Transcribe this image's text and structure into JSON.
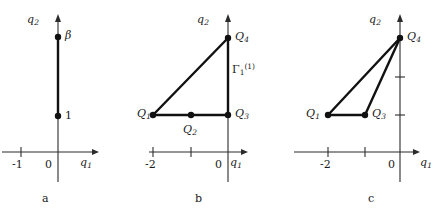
{
  "figure": {
    "axis_labels": {
      "x": "q",
      "x_sub": "1",
      "y": "q",
      "y_sub": "2"
    },
    "panels": [
      {
        "letter": "a",
        "ticks_x": [
          {
            "label": "-1",
            "value": -1
          },
          {
            "label": "0",
            "value": 0
          }
        ],
        "points": [
          {
            "name": "beta-point",
            "label": "β",
            "x": 0,
            "y": 3
          },
          {
            "name": "one-point",
            "label": "1",
            "x": 0,
            "y": 1
          }
        ],
        "segments": [
          {
            "from": [
              0,
              1
            ],
            "to": [
              0,
              3
            ]
          }
        ]
      },
      {
        "letter": "b",
        "ticks_x": [
          {
            "label": "-2",
            "value": -2
          },
          {
            "label": "",
            "value": -1
          },
          {
            "label": "0",
            "value": 0
          }
        ],
        "edge_label": {
          "text": "Γ",
          "sub": "1",
          "sup": "(1)"
        },
        "points": [
          {
            "name": "Q1",
            "label": "Q",
            "sub": "1",
            "x": -2,
            "y": 1
          },
          {
            "name": "Q2",
            "label": "Q",
            "sub": "2",
            "x": -1,
            "y": 1
          },
          {
            "name": "Q3",
            "label": "Q",
            "sub": "3",
            "x": 0,
            "y": 1
          },
          {
            "name": "Q4",
            "label": "Q",
            "sub": "4",
            "x": 0,
            "y": 3
          }
        ],
        "segments": [
          {
            "from": [
              -2,
              1
            ],
            "to": [
              0,
              1
            ]
          },
          {
            "from": [
              0,
              1
            ],
            "to": [
              0,
              3
            ]
          },
          {
            "from": [
              -2,
              1
            ],
            "to": [
              0,
              3
            ]
          }
        ]
      },
      {
        "letter": "c",
        "ticks_x": [
          {
            "label": "-2",
            "value": -2
          },
          {
            "label": "",
            "value": -1
          },
          {
            "label": "0",
            "value": 0
          }
        ],
        "ticks_y": [
          {
            "label": "",
            "value": 1
          },
          {
            "label": "",
            "value": 2
          }
        ],
        "points": [
          {
            "name": "Q1",
            "label": "Q",
            "sub": "1",
            "x": -2,
            "y": 1
          },
          {
            "name": "Q3",
            "label": "Q",
            "sub": "3",
            "x": -1,
            "y": 1
          },
          {
            "name": "Q4",
            "label": "Q",
            "sub": "4",
            "x": 0,
            "y": 3
          }
        ],
        "segments": [
          {
            "from": [
              -2,
              1
            ],
            "to": [
              -1,
              1
            ]
          },
          {
            "from": [
              -1,
              1
            ],
            "to": [
              0,
              3
            ]
          },
          {
            "from": [
              -2,
              1
            ],
            "to": [
              0,
              3
            ]
          }
        ]
      }
    ]
  }
}
